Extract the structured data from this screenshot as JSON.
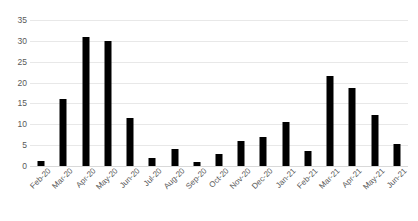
{
  "chart_data": {
    "type": "bar",
    "title": "",
    "subtitle": "",
    "xlabel": "",
    "ylabel": "",
    "ylim": [
      0,
      35
    ],
    "ytick_step": 5,
    "yticks": [
      0,
      5,
      10,
      15,
      20,
      25,
      30,
      35
    ],
    "grid": true,
    "legend": false,
    "legend_position": "none",
    "bar_color": "#000000",
    "gridline_color": "#E8E8E8",
    "tick_label_color": "#595959",
    "xtick_rotation_deg": -45,
    "categories": [
      "Feb-20",
      "Mar-20",
      "Apr-20",
      "May-20",
      "Jun-20",
      "Jul-20",
      "Aug-20",
      "Sep-20",
      "Oct-20",
      "Nov-20",
      "Dec-20",
      "Jan-21",
      "Feb-21",
      "Mar-21",
      "Apr-21",
      "May-21",
      "Jun-21"
    ],
    "values": [
      1.3,
      16,
      31,
      30,
      11.5,
      2,
      4,
      1,
      3,
      6,
      7,
      10.5,
      3.5,
      21.5,
      18.8,
      12.3,
      5.3
    ],
    "series": [
      {
        "name": "",
        "values": [
          1.3,
          16,
          31,
          30,
          11.5,
          2,
          4,
          1,
          3,
          6,
          7,
          10.5,
          3.5,
          21.5,
          18.8,
          12.3,
          5.3
        ]
      }
    ]
  }
}
